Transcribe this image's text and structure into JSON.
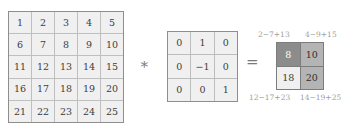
{
  "diagram": {
    "operators": {
      "convolution": "∗",
      "equals": "="
    },
    "colors": {
      "cell_fill": "#f0f0f0",
      "grid_line": "#bfbfbf",
      "border": "#8e8e8e",
      "text": "#3c3c3c",
      "annotation_text": "#9d9d9d",
      "shade_dark": "#8c8c8c",
      "shade_medium": "#b4b4b4",
      "shade_light": "#f0f0f0"
    },
    "input_matrix": {
      "name": "input",
      "rows": 5,
      "cols": 5,
      "values": [
        [
          "1",
          "2",
          "3",
          "4",
          "5"
        ],
        [
          "6",
          "7",
          "8",
          "9",
          "10"
        ],
        [
          "11",
          "12",
          "13",
          "14",
          "15"
        ],
        [
          "16",
          "17",
          "18",
          "19",
          "20"
        ],
        [
          "21",
          "22",
          "23",
          "24",
          "25"
        ]
      ]
    },
    "kernel_matrix": {
      "name": "kernel",
      "rows": 3,
      "cols": 3,
      "values": [
        [
          "0",
          "1",
          "0"
        ],
        [
          "0",
          "−1",
          "0"
        ],
        [
          "0",
          "0",
          "1"
        ]
      ]
    },
    "result_matrix": {
      "name": "result",
      "rows": 2,
      "cols": 2,
      "values": [
        [
          "8",
          "10"
        ],
        [
          "18",
          "20"
        ]
      ],
      "shades": [
        [
          "dark",
          "medium"
        ],
        [
          "light",
          "medium"
        ]
      ]
    },
    "annotations": {
      "top_left": "2−7+13",
      "top_right": "4−9+15",
      "bottom_left": "12−17+23",
      "bottom_right": "14−19+25"
    }
  }
}
